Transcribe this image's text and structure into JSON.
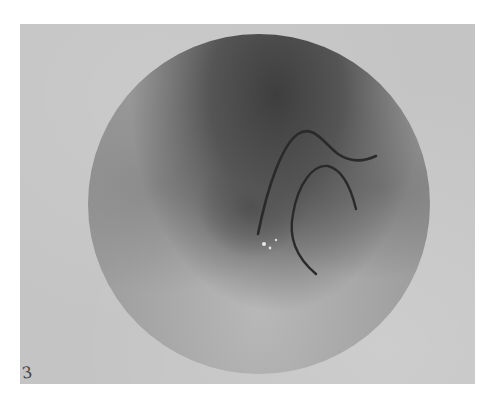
{
  "image": {
    "subject": "circular grayscale fundus/microscopy photograph with dark curved worm-like structures",
    "corner_label": "3",
    "colors": {
      "frame": "#c4c4c4",
      "dark_region": "#3e3e3e",
      "vessel": "#2a2a2a",
      "background": "#ffffff"
    }
  }
}
